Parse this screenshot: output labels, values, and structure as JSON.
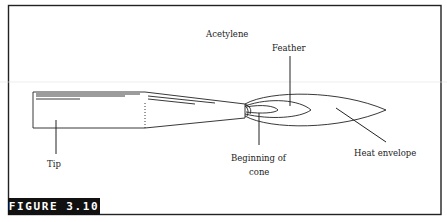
{
  "figure": {
    "label": "FIGURE 3.10",
    "label_bg": "#111111",
    "label_fg": "#ffffff",
    "border_color": "#222222"
  },
  "labels": {
    "acetylene": "Acetylene",
    "feather": "Feather",
    "tip": "Tip",
    "beginning_of_cone_line1": "Beginning of",
    "beginning_of_cone_line2": "cone",
    "heat_envelope": "Heat envelope"
  }
}
